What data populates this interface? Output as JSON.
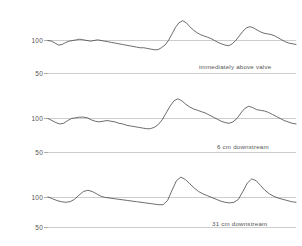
{
  "chart_data": {
    "type": "line",
    "title": "",
    "xlabel": "",
    "ylabel": "PRESSURE (mm Hg)",
    "ylim": [
      45,
      135
    ],
    "grid": true,
    "gridlines": [
      100,
      50
    ],
    "legend_position": "inline-right",
    "panels": [
      {
        "label": "immediately above valve",
        "yticks": [
          100,
          50
        ],
        "ytick_labels": [
          "100",
          "50"
        ],
        "series": [
          {
            "name": "pressure-trace-above-valve",
            "x": [
              0,
              2,
              4,
              6,
              8,
              10,
              12,
              14,
              16,
              18,
              20,
              22,
              24,
              26,
              28,
              30,
              32,
              34,
              36,
              38,
              40,
              42,
              44,
              46,
              48,
              50,
              52,
              54,
              56,
              58,
              60,
              62,
              64,
              66,
              68,
              70,
              72,
              74,
              76,
              78,
              80,
              82,
              84,
              86,
              88,
              90,
              92,
              94,
              96,
              98,
              100
            ],
            "values": [
              100,
              99,
              96,
              93,
              94,
              97,
              99,
              100,
              101,
              102,
              101,
              100,
              99,
              100,
              101,
              100,
              99,
              98,
              97,
              96,
              95,
              94,
              93,
              92,
              91,
              90,
              89,
              89,
              88,
              87,
              86,
              86,
              89,
              93,
              100,
              110,
              120,
              127,
              130,
              127,
              121,
              116,
              112,
              109,
              107,
              105,
              103,
              100,
              97,
              95,
              93,
              92,
              95,
              100,
              107,
              114,
              119,
              121,
              119,
              116,
              113,
              111,
              110,
              109,
              107,
              104,
              101,
              98,
              96,
              95,
              94
            ]
          }
        ]
      },
      {
        "label": "6 cm downstream",
        "yticks": [
          100,
          50
        ],
        "ytick_labels": [
          "100",
          "50"
        ],
        "series": [
          {
            "name": "pressure-trace-6cm",
            "x": [
              0,
              2,
              4,
              6,
              8,
              10,
              12,
              14,
              16,
              18,
              20,
              22,
              24,
              26,
              28,
              30,
              32,
              34,
              36,
              38,
              40,
              42,
              44,
              46,
              48,
              50,
              52,
              54,
              56,
              58,
              60,
              62,
              64,
              66,
              68,
              70,
              72,
              74,
              76,
              78,
              80,
              82,
              84,
              86,
              88,
              90,
              92,
              94,
              96,
              98,
              100
            ],
            "values": [
              100,
              97,
              94,
              92,
              93,
              97,
              100,
              101,
              102,
              102,
              101,
              98,
              96,
              95,
              96,
              97,
              96,
              95,
              93,
              92,
              90,
              89,
              88,
              87,
              86,
              85,
              85,
              87,
              91,
              98,
              108,
              118,
              126,
              129,
              126,
              121,
              117,
              114,
              112,
              110,
              108,
              105,
              102,
              99,
              96,
              94,
              93,
              95,
              100,
              108,
              115,
              118,
              116,
              113,
              112,
              111,
              109,
              106,
              103,
              100,
              97,
              95,
              93,
              92
            ]
          }
        ]
      },
      {
        "label": "31 cm downstream",
        "yticks": [
          100,
          50
        ],
        "ytick_labels": [
          "100",
          "50"
        ],
        "series": [
          {
            "name": "pressure-trace-31cm",
            "x": [
              0,
              2,
              4,
              6,
              8,
              10,
              12,
              14,
              16,
              18,
              20,
              22,
              24,
              26,
              28,
              30,
              32,
              34,
              36,
              38,
              40,
              42,
              44,
              46,
              48,
              50,
              52,
              54,
              56,
              58,
              60,
              62,
              64,
              66,
              68,
              70,
              72,
              74,
              76,
              78,
              80,
              82,
              84,
              86,
              88,
              90,
              92,
              94,
              96,
              98,
              100
            ],
            "values": [
              101,
              98,
              95,
              93,
              92,
              93,
              97,
              104,
              110,
              112,
              110,
              106,
              102,
              100,
              99,
              98,
              97,
              96,
              95,
              94,
              93,
              92,
              91,
              90,
              89,
              88,
              88,
              95,
              112,
              128,
              134,
              130,
              123,
              116,
              110,
              106,
              103,
              100,
              97,
              94,
              92,
              91,
              92,
              97,
              110,
              124,
              131,
              128,
              120,
              112,
              106,
              102,
              99,
              97,
              95,
              93,
              92
            ]
          }
        ]
      }
    ]
  },
  "axis": {
    "ylabel": "PRESSURE (mm Hg)"
  },
  "labels": {
    "panel1_tick_top": "100",
    "panel1_tick_bottom": "50",
    "panel2_tick_top": "100",
    "panel2_tick_bottom": "50",
    "panel3_tick_top": "100",
    "panel3_tick_bottom": "50",
    "panel1_caption": "immediately above valve",
    "panel2_caption": "6 cm downstream",
    "panel3_caption": "31 cm downstream"
  },
  "colors": {
    "trace": "#3c3c3c",
    "trace_soft": "#8e8e8e",
    "gridline": "#9a9a9a",
    "text": "#555555",
    "background": "#ffffff"
  }
}
